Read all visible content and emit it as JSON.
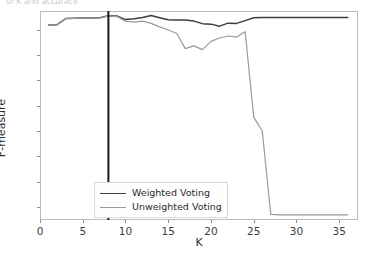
{
  "cropped_top_text": "of K and accuracy",
  "chart_data": {
    "type": "line",
    "title": "",
    "xlabel": "K",
    "ylabel": "F-measure",
    "xlim": [
      0,
      37.2
    ],
    "ylim": [
      0.148,
      0.975
    ],
    "xticks": [
      0,
      5,
      10,
      15,
      20,
      25,
      30,
      35
    ],
    "yticks": [
      0.2,
      0.3,
      0.4,
      0.5,
      0.6,
      0.7,
      0.8,
      0.9
    ],
    "grid": false,
    "legend_position": "lower center",
    "annotations": [
      {
        "type": "vertical-line",
        "x": 8,
        "color": "#1a1a1a",
        "label": "K = 8"
      }
    ],
    "x": [
      1,
      2,
      3,
      4,
      5,
      6,
      7,
      8,
      9,
      10,
      11,
      12,
      13,
      14,
      15,
      16,
      17,
      18,
      19,
      20,
      21,
      22,
      23,
      24,
      25,
      26,
      27,
      28,
      29,
      30,
      31,
      32,
      33,
      34,
      35,
      36
    ],
    "series": [
      {
        "name": "Weighted Voting",
        "color": "#3d3d3d",
        "values": [
          0.92,
          0.921,
          0.945,
          0.946,
          0.947,
          0.947,
          0.948,
          0.956,
          0.955,
          0.941,
          0.944,
          0.949,
          0.957,
          0.948,
          0.94,
          0.939,
          0.939,
          0.935,
          0.925,
          0.923,
          0.915,
          0.927,
          0.926,
          0.937,
          0.948,
          0.949,
          0.949,
          0.949,
          0.949,
          0.949,
          0.949,
          0.949,
          0.949,
          0.949,
          0.949,
          0.949
        ]
      },
      {
        "name": "Unweighted Voting",
        "color": "#9a9a9a",
        "values": [
          0.92,
          0.921,
          0.945,
          0.946,
          0.947,
          0.947,
          0.948,
          0.956,
          0.953,
          0.935,
          0.931,
          0.935,
          0.926,
          0.912,
          0.9,
          0.886,
          0.826,
          0.837,
          0.822,
          0.855,
          0.868,
          0.876,
          0.872,
          0.893,
          0.555,
          0.5,
          0.17,
          0.168,
          0.168,
          0.168,
          0.168,
          0.168,
          0.168,
          0.168,
          0.168,
          0.168
        ]
      }
    ]
  },
  "legend": {
    "items": [
      {
        "label": "Weighted Voting",
        "color": "#3d3d3d"
      },
      {
        "label": "Unweighted Voting",
        "color": "#9a9a9a"
      }
    ]
  }
}
